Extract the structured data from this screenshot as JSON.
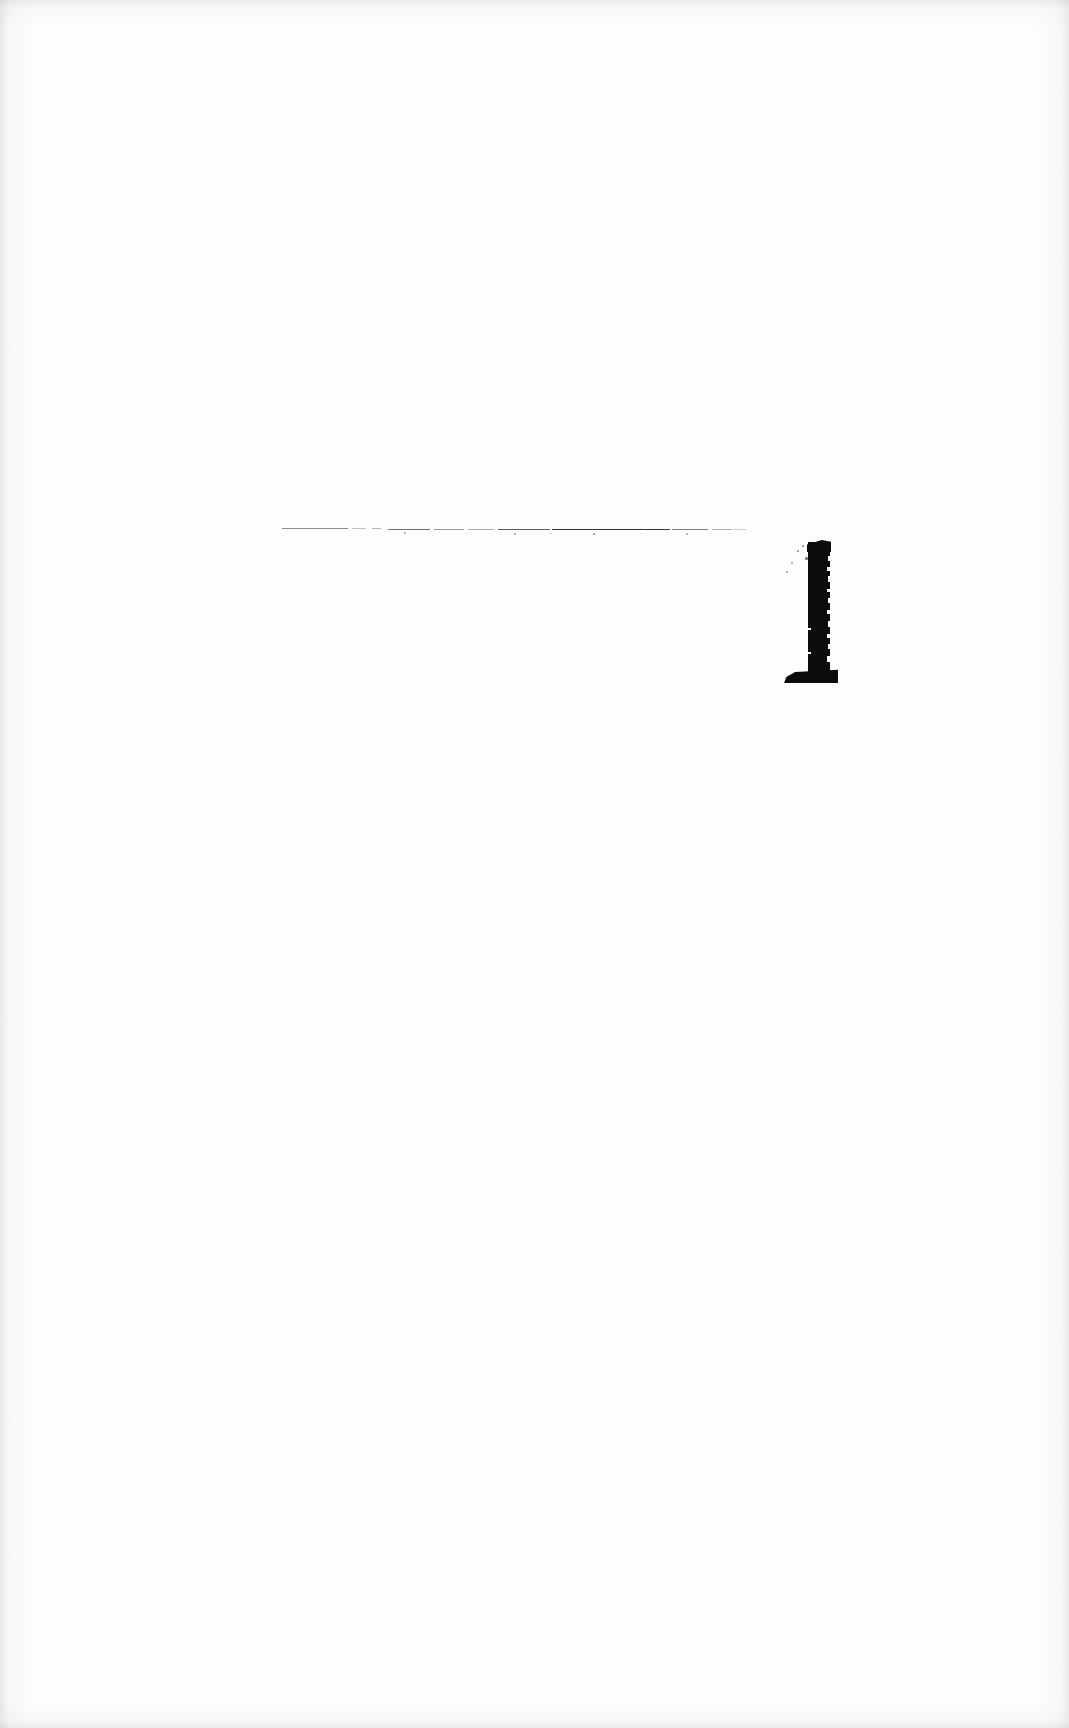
{
  "document": {
    "kind": "scanned-page",
    "page_width": 1069,
    "page_height": 1728,
    "background_color": "#fdfdfd",
    "ink_color": "#0c0c0c",
    "visible_text": "",
    "notes_label": "",
    "caption": ""
  },
  "marks": {
    "horizontal_rule": {
      "label": "",
      "x_start": 282,
      "x_end": 746,
      "y": 529,
      "thickness": 1,
      "color": "#1b1b1b",
      "segments": [
        {
          "left": 0,
          "top": 4.2,
          "width": 66,
          "opacity": 0.5
        },
        {
          "left": 70,
          "top": 4.3,
          "width": 14,
          "opacity": 0.26
        },
        {
          "left": 90,
          "top": 4.4,
          "width": 9,
          "opacity": 0.3
        },
        {
          "left": 106,
          "top": 4.5,
          "width": 42,
          "opacity": 0.62
        },
        {
          "left": 152,
          "top": 4.6,
          "width": 30,
          "opacity": 0.42
        },
        {
          "left": 186,
          "top": 4.7,
          "width": 26,
          "opacity": 0.35
        },
        {
          "left": 216,
          "top": 4.8,
          "width": 52,
          "opacity": 0.7
        },
        {
          "left": 270,
          "top": 5.0,
          "width": 118,
          "opacity": 0.88
        },
        {
          "left": 390,
          "top": 5.2,
          "width": 36,
          "opacity": 0.56
        },
        {
          "left": 430,
          "top": 5.3,
          "width": 20,
          "opacity": 0.34
        },
        {
          "left": 452,
          "top": 5.4,
          "width": 12,
          "opacity": 0.22
        }
      ],
      "specks": [
        {
          "left": 122,
          "top": 8.4,
          "size": 1.6,
          "opacity": 0.4
        },
        {
          "left": 184,
          "top": 8.8,
          "size": 1.4,
          "opacity": 0.3
        },
        {
          "left": 232,
          "top": 9.0,
          "size": 1.8,
          "opacity": 0.45
        },
        {
          "left": 268,
          "top": 8.6,
          "size": 1.5,
          "opacity": 0.34
        },
        {
          "left": 311,
          "top": 9.2,
          "size": 2.0,
          "opacity": 0.5
        },
        {
          "left": 358,
          "top": 8.9,
          "size": 1.4,
          "opacity": 0.28
        },
        {
          "left": 404,
          "top": 9.4,
          "size": 1.6,
          "opacity": 0.36
        },
        {
          "left": 447,
          "top": 9.0,
          "size": 1.3,
          "opacity": 0.24
        }
      ]
    },
    "glyph": {
      "label": "",
      "x": 783,
      "y": 540,
      "width": 58,
      "height": 146,
      "stem_x": 808,
      "stem_y": 542,
      "stem_width": 22,
      "stem_height": 134,
      "foot_x_start": 783,
      "foot_x_end": 838,
      "foot_y": 669,
      "color": "#0c0c0c",
      "notches": [
        {
          "left": 45,
          "top": 16,
          "width": 3,
          "height": 5
        },
        {
          "left": 44,
          "top": 27,
          "width": 4,
          "height": 4
        },
        {
          "left": 45,
          "top": 36,
          "width": 3,
          "height": 6
        },
        {
          "left": 44,
          "top": 49,
          "width": 4,
          "height": 3
        },
        {
          "left": 45,
          "top": 58,
          "width": 3,
          "height": 5
        },
        {
          "left": 44,
          "top": 70,
          "width": 4,
          "height": 4
        },
        {
          "left": 45,
          "top": 81,
          "width": 3,
          "height": 6
        },
        {
          "left": 44,
          "top": 94,
          "width": 4,
          "height": 4
        },
        {
          "left": 45,
          "top": 104,
          "width": 3,
          "height": 5
        },
        {
          "left": 44,
          "top": 116,
          "width": 4,
          "height": 6
        },
        {
          "left": 25,
          "top": 88,
          "width": 3,
          "height": 2
        },
        {
          "left": 25,
          "top": 112,
          "width": 3,
          "height": 2
        }
      ],
      "flecks": [
        {
          "left": 14,
          "top": 10,
          "size": 2.2,
          "opacity": 0.55
        },
        {
          "left": 8,
          "top": 22,
          "size": 1.8,
          "opacity": 0.42
        },
        {
          "left": 19,
          "top": 5,
          "size": 1.6,
          "opacity": 0.48
        },
        {
          "left": 22,
          "top": 17,
          "size": 2.6,
          "opacity": 0.62
        },
        {
          "left": 3,
          "top": 31,
          "size": 1.5,
          "opacity": 0.34
        },
        {
          "left": 30,
          "top": 2,
          "size": 2.0,
          "opacity": 0.5
        }
      ]
    }
  }
}
